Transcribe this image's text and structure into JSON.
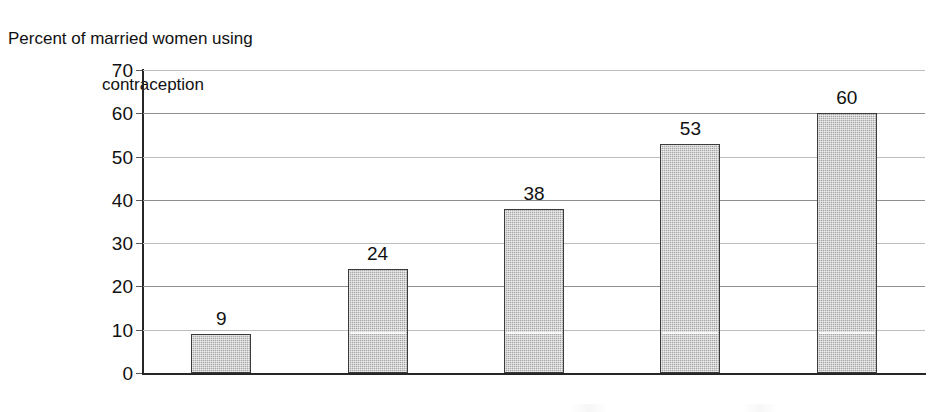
{
  "chart_data": {
    "type": "bar",
    "title": "Percent of married women using contraception",
    "title_line1": "Percent of married women using",
    "title_line2": "contraception",
    "xlabel": "",
    "ylabel": "",
    "categories": [
      "1960",
      "1970",
      "1980",
      "1990",
      "late 1990s"
    ],
    "values": [
      9,
      24,
      38,
      53,
      60
    ],
    "value_labels": [
      "9",
      "24",
      "38",
      "53",
      "60"
    ],
    "ylim": [
      0,
      70
    ],
    "ytick_step": 10,
    "yticks": [
      0,
      10,
      20,
      30,
      40,
      50,
      60,
      70
    ],
    "ytick_labels": [
      "0",
      "10",
      "20",
      "30",
      "40",
      "50",
      "60",
      "70"
    ],
    "grid": true,
    "grid_axis": "y",
    "legend": false,
    "legend_position": "none",
    "series": [
      {
        "name": "Percent of married women using contraception",
        "values": [
          9,
          24,
          38,
          53,
          60
        ]
      }
    ],
    "colors": {
      "bar_fill": "#a6a6a6",
      "bar_border": "#3b3b3b",
      "axis": "#262626",
      "gridline": "#8e8e8e",
      "text": "#111111",
      "background": "#ffffff"
    }
  }
}
